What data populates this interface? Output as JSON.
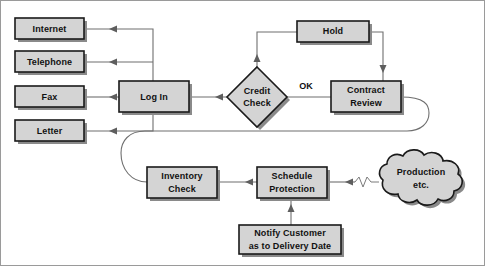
{
  "diagram": {
    "background_color": "#ffffff",
    "node_fill_color": "#d4d4d4",
    "node_stroke_color": "#1a1a1a",
    "connector_color": "#6f6f6f",
    "nodes": [
      {
        "id": "internet",
        "shape": "rectangle",
        "label": "Internet"
      },
      {
        "id": "telephone",
        "shape": "rectangle",
        "label": "Telephone"
      },
      {
        "id": "fax",
        "shape": "rectangle",
        "label": "Fax"
      },
      {
        "id": "letter",
        "shape": "rectangle",
        "label": "Letter"
      },
      {
        "id": "login",
        "shape": "rectangle",
        "label": "Log In"
      },
      {
        "id": "credit",
        "shape": "diamond",
        "label_line1": "Credit",
        "label_line2": "Check"
      },
      {
        "id": "hold",
        "shape": "rectangle",
        "label": "Hold"
      },
      {
        "id": "contract",
        "shape": "rectangle",
        "label_line1": "Contract",
        "label_line2": "Review"
      },
      {
        "id": "inventory",
        "shape": "rectangle",
        "label_line1": "Inventory",
        "label_line2": "Check"
      },
      {
        "id": "schedule",
        "shape": "rectangle",
        "label_line1": "Schedule",
        "label_line2": "Protection"
      },
      {
        "id": "notify",
        "shape": "rectangle",
        "label_line1": "Notify Customer",
        "label_line2": "as to Delivery Date"
      },
      {
        "id": "production",
        "shape": "cloud",
        "label_line1": "Production",
        "label_line2": "etc."
      }
    ],
    "edge_labels": {
      "credit_to_contract": "OK"
    }
  }
}
